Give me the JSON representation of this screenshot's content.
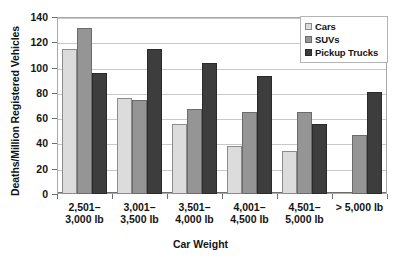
{
  "chart_data": {
    "type": "bar",
    "title": "",
    "xlabel": "Car Weight",
    "ylabel": "Deaths/Million Registered Vehicles",
    "ylim": [
      0,
      140
    ],
    "yticks": [
      0,
      20,
      40,
      60,
      80,
      100,
      120,
      140
    ],
    "ytick_labels": [
      "0",
      "20",
      "40",
      "60",
      "80",
      "100",
      "120",
      "140"
    ],
    "grid": "horizontal",
    "legend_position": "top-right",
    "categories": [
      "2,501–3,000 lb",
      "3,001–3,500 lb",
      "3,501–4,000 lb",
      "4,001–4,500 lb",
      "4,501–5,000 lb",
      "> 5,000 lb"
    ],
    "category_lines": [
      [
        "2,501–",
        "3,000 lb"
      ],
      [
        "3,001–",
        "3,500 lb"
      ],
      [
        "3,501–",
        "4,000 lb"
      ],
      [
        "4,001–",
        "4,500 lb"
      ],
      [
        "4,501–",
        "5,000 lb"
      ],
      [
        "> 5,000 lb",
        ""
      ]
    ],
    "series": [
      {
        "name": "Cars",
        "color": "#dcdcdc",
        "values": [
          115,
          76,
          55,
          38,
          34,
          null
        ]
      },
      {
        "name": "SUVs",
        "color": "#959595",
        "values": [
          131,
          74,
          67,
          65,
          65,
          47
        ]
      },
      {
        "name": "Pickup Trucks",
        "color": "#3d3d3d",
        "values": [
          96,
          115,
          104,
          93,
          55,
          81
        ]
      }
    ]
  },
  "legend": {
    "items": [
      {
        "label": "Cars"
      },
      {
        "label": "SUVs"
      },
      {
        "label": "Pickup Trucks"
      }
    ]
  }
}
